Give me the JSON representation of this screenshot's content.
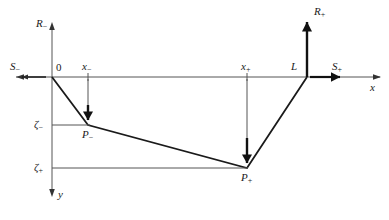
{
  "figure": {
    "type": "engineering-schematic",
    "colors": {
      "stroke": "#1a1a1a",
      "thin_stroke": "#4d4d4d",
      "background": "#ffffff"
    },
    "axes": {
      "x_axis_label": "x",
      "y_axis_label": "y",
      "origin_label": "0"
    },
    "labels": {
      "reaction_left": {
        "base": "R",
        "sub": "−"
      },
      "reaction_right": {
        "base": "R",
        "sub": "+"
      },
      "shear_left": {
        "base": "S",
        "sub": "−"
      },
      "shear_right": {
        "base": "S",
        "sub": "+"
      },
      "load_pos_left": {
        "base": "x",
        "sub": "−"
      },
      "load_pos_right": {
        "base": "x",
        "sub": "+"
      },
      "span_end": "L",
      "point_left": {
        "base": "P",
        "sub": "−"
      },
      "point_right": {
        "base": "P",
        "sub": "+"
      },
      "deflection_left": {
        "base": "ζ",
        "sub": "−"
      },
      "deflection_right": {
        "base": "ζ",
        "sub": "+"
      }
    },
    "geometry": {
      "x_axis_y": 77,
      "y_axis_x": 52,
      "origin": {
        "x": 52,
        "y": 77
      },
      "point_left": {
        "x": 88,
        "y": 125
      },
      "point_right": {
        "x": 247,
        "y": 168
      },
      "span_end_x": 307,
      "load_left_x": 88,
      "load_right_x": 247,
      "zeta_left_y": 125,
      "zeta_right_y": 168
    }
  }
}
